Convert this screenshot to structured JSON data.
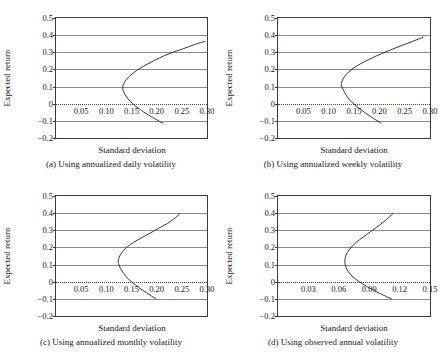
{
  "figure": {
    "axis_color": "#3a3a3a",
    "grid_color": "#8c8c8c",
    "curve_color": "#222222",
    "background": "#ffffff"
  },
  "chart_data": [
    {
      "type": "line",
      "panel": "a",
      "title": "(a) Using annualized daily volatility",
      "xlabel": "Standard deviation",
      "ylabel": "Expected return",
      "xlim": [
        0.0,
        0.3
      ],
      "ylim": [
        -0.2,
        0.5
      ],
      "grid": true,
      "xticks": [
        0.05,
        0.1,
        0.15,
        0.2,
        0.25,
        0.3
      ],
      "xticklabels": [
        "0.05",
        "0.10",
        "0.15",
        "0.20",
        "0.25",
        "0.30"
      ],
      "yticks": [
        -0.2,
        -0.1,
        0,
        0.1,
        0.2,
        0.3,
        0.4,
        0.5
      ],
      "yticklabels": [
        "−0.2",
        "−0.1",
        "0",
        "0.1",
        "0.2",
        "0.3",
        "0.4",
        "0.5"
      ],
      "series": [
        {
          "name": "efficient frontier",
          "x": [
            0.213,
            0.189,
            0.17,
            0.157,
            0.147,
            0.139,
            0.1345,
            0.1325,
            0.133,
            0.137,
            0.144,
            0.154,
            0.166,
            0.181,
            0.197,
            0.215,
            0.234,
            0.254,
            0.275,
            0.297
          ],
          "y": [
            -0.115,
            -0.075,
            -0.04,
            -0.01,
            0.015,
            0.045,
            0.07,
            0.09,
            0.105,
            0.13,
            0.155,
            0.18,
            0.205,
            0.23,
            0.255,
            0.28,
            0.302,
            0.322,
            0.345,
            0.365
          ]
        }
      ]
    },
    {
      "type": "line",
      "panel": "b",
      "title": "(b) Using annualized weekly volatility",
      "xlabel": "Standard deviation",
      "ylabel": "Expected return",
      "xlim": [
        0.0,
        0.3
      ],
      "ylim": [
        -0.2,
        0.5
      ],
      "grid": true,
      "xticks": [
        0.05,
        0.1,
        0.15,
        0.2,
        0.25,
        0.3
      ],
      "xticklabels": [
        "0.05",
        "0.10",
        "0.15",
        "0.20",
        "0.25",
        "0.30"
      ],
      "yticks": [
        -0.2,
        -0.1,
        0,
        0.1,
        0.2,
        0.3,
        0.4,
        0.5
      ],
      "yticklabels": [
        "−0.2",
        "−0.1",
        "0",
        "0.1",
        "0.2",
        "0.3",
        "0.4",
        "0.5"
      ],
      "series": [
        {
          "name": "efficient frontier",
          "x": [
            0.203,
            0.182,
            0.165,
            0.152,
            0.142,
            0.1345,
            0.129,
            0.1258,
            0.125,
            0.1285,
            0.135,
            0.1445,
            0.1565,
            0.1705,
            0.1865,
            0.204,
            0.223,
            0.243,
            0.264,
            0.287
          ],
          "y": [
            -0.113,
            -0.073,
            -0.038,
            -0.008,
            0.02,
            0.05,
            0.08,
            0.102,
            0.118,
            0.145,
            0.172,
            0.198,
            0.222,
            0.245,
            0.268,
            0.292,
            0.315,
            0.338,
            0.362,
            0.388
          ]
        }
      ]
    },
    {
      "type": "line",
      "panel": "c",
      "title": "(c) Using annualized monthly volatility",
      "xlabel": "Standard deviation",
      "ylabel": "Expected return",
      "xlim": [
        0.0,
        0.3
      ],
      "ylim": [
        -0.2,
        0.5
      ],
      "grid": true,
      "xticks": [
        0.05,
        0.1,
        0.15,
        0.2,
        0.25,
        0.3
      ],
      "xticklabels": [
        "0.05",
        "0.10",
        "0.15",
        "0.20",
        "0.25",
        "0.30"
      ],
      "yticks": [
        -0.2,
        -0.1,
        0,
        0.1,
        0.2,
        0.3,
        0.4,
        0.5
      ],
      "yticklabels": [
        "−0.2",
        "−0.1",
        "0",
        "0.1",
        "0.2",
        "0.3",
        "0.4",
        "0.5"
      ],
      "series": [
        {
          "name": "efficient frontier",
          "x": [
            0.1985,
            0.18,
            0.164,
            0.151,
            0.1405,
            0.133,
            0.1275,
            0.1243,
            0.1235,
            0.1265,
            0.133,
            0.1425,
            0.1545,
            0.169,
            0.185,
            0.2025,
            0.2215,
            0.242,
            0.245
          ],
          "y": [
            -0.1,
            -0.065,
            -0.033,
            -0.003,
            0.025,
            0.055,
            0.082,
            0.105,
            0.122,
            0.15,
            0.178,
            0.205,
            0.23,
            0.255,
            0.28,
            0.31,
            0.34,
            0.385,
            0.4
          ]
        }
      ]
    },
    {
      "type": "line",
      "panel": "d",
      "title": "(d) Using observed annual volatility",
      "xlabel": "Standard deviation",
      "ylabel": "Expected return",
      "xlim": [
        0.0,
        0.15
      ],
      "ylim": [
        -0.2,
        0.5
      ],
      "grid": true,
      "xticks": [
        0.03,
        0.06,
        0.09,
        0.12,
        0.15
      ],
      "xticklabels": [
        "0.03",
        "0.06",
        "0.09",
        "0.12",
        "0.15"
      ],
      "yticks": [
        -0.2,
        -0.1,
        0,
        0.1,
        0.2,
        0.3,
        0.4,
        0.5
      ],
      "yticklabels": [
        "−0.2",
        "−0.1",
        "0",
        "0.1",
        "0.2",
        "0.3",
        "0.4",
        "0.5"
      ],
      "series": [
        {
          "name": "efficient frontier",
          "x": [
            0.112,
            0.101,
            0.092,
            0.085,
            0.079,
            0.074,
            0.0705,
            0.068,
            0.0665,
            0.066,
            0.0672,
            0.07,
            0.0745,
            0.0805,
            0.0875,
            0.0955,
            0.1045,
            0.114
          ],
          "y": [
            -0.1,
            -0.07,
            -0.042,
            -0.018,
            0.005,
            0.028,
            0.05,
            0.072,
            0.095,
            0.125,
            0.155,
            0.185,
            0.215,
            0.245,
            0.275,
            0.31,
            0.35,
            0.4
          ]
        }
      ]
    }
  ]
}
